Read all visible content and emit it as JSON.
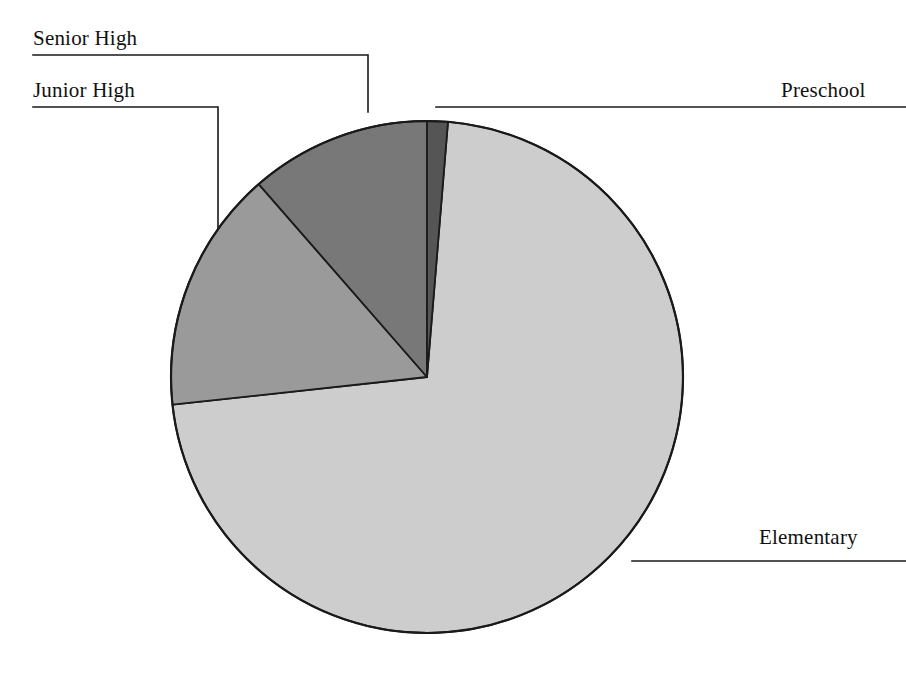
{
  "figure": {
    "width": 906,
    "height": 691,
    "background": "#ffffff",
    "line_color": "#1a1a1a",
    "text_color": "#111111"
  },
  "chart_data": {
    "type": "pie",
    "title": "",
    "subtitle": "",
    "xlabel": "",
    "ylabel": "",
    "grid": false,
    "legend_position": "callout-labels",
    "labels": [
      "Preschool",
      "Senior High",
      "Junior High",
      "Elementary"
    ],
    "values": [
      1.3,
      11.4,
      15.3,
      72.0
    ],
    "value_unit": "percent",
    "colors": [
      "#555555",
      "#787878",
      "#9a9a9a",
      "#cdcdcd"
    ],
    "slices": [
      {
        "name": "Preschool",
        "label": "Preschool",
        "percent": 1.3,
        "color": "#555555",
        "start_angle_deg": 0.0,
        "end_angle_deg": 4.7,
        "label_side": "right",
        "label_x": 781,
        "label_y": 80
      },
      {
        "name": "Senior High",
        "label": "Senior High",
        "percent": 11.4,
        "color": "#787878",
        "start_angle_deg": 318.9,
        "end_angle_deg": 360.0,
        "label_side": "left",
        "label_x": 33,
        "label_y": 28
      },
      {
        "name": "Junior High",
        "label": "Junior High",
        "percent": 15.3,
        "color": "#9a9a9a",
        "start_angle_deg": 263.8,
        "end_angle_deg": 318.9,
        "label_side": "left",
        "label_x": 33,
        "label_y": 80
      },
      {
        "name": "Elementary",
        "label": "Elementary",
        "percent": 72.0,
        "color": "#cdcdcd",
        "start_angle_deg": 4.7,
        "end_angle_deg": 263.8,
        "label_side": "right",
        "label_x": 759,
        "label_y": 527
      }
    ],
    "geometry": {
      "center_x": 427,
      "center_y": 377,
      "radius": 256
    },
    "annotations": [
      "Senior High",
      "Junior High",
      "Preschool",
      "Elementary"
    ]
  },
  "labels": {
    "senior_high": "Senior High",
    "junior_high": "Junior High",
    "preschool": "Preschool",
    "elementary": "Elementary"
  }
}
